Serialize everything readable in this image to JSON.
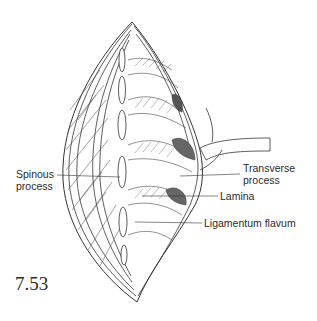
{
  "figure": {
    "number": "7.53",
    "line_color": "#333333",
    "background": "#ffffff"
  },
  "labels": {
    "spinous_process": {
      "line1": "Spinous",
      "line2": "process"
    },
    "transverse_process": {
      "line1": "Transverse",
      "line2": "process"
    },
    "lamina": {
      "text": "Lamina"
    },
    "ligamentum_flavum": {
      "text": "Ligamentum flavum"
    }
  }
}
